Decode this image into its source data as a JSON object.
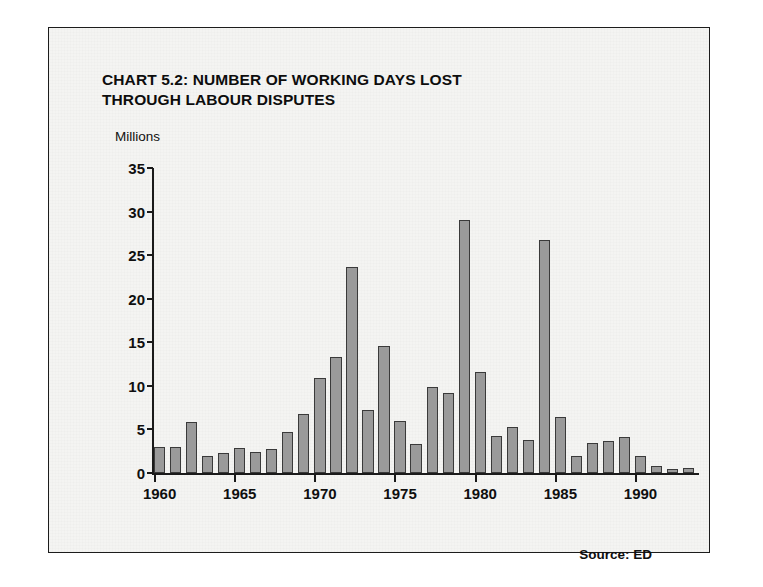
{
  "panel": {
    "title_line1": "CHART 5.2: NUMBER OF WORKING DAYS LOST",
    "title_line2": "THROUGH LABOUR DISPUTES",
    "source": "Source: ED",
    "axis_unit_caption": "Millions"
  },
  "colors": {
    "bar_fill": "#9a9a9a",
    "bar_border": "#3a3a3a",
    "axis": "#1a1a1a",
    "text": "#0f0f0f",
    "paper": "#f4f4f2"
  },
  "chart_data": {
    "type": "bar",
    "title": "CHART 5.2: NUMBER OF WORKING DAYS LOST THROUGH LABOUR DISPUTES",
    "subtitle": "",
    "xlabel": "",
    "ylabel": "Millions",
    "ylim": [
      0,
      35
    ],
    "yticks": [
      0,
      5,
      10,
      15,
      20,
      25,
      30,
      35
    ],
    "ytick_labels": [
      "0",
      "5",
      "10",
      "15",
      "20",
      "25",
      "30",
      "35"
    ],
    "xticks": [
      1960,
      1965,
      1970,
      1975,
      1980,
      1985,
      1990
    ],
    "xtick_labels": [
      "1960",
      "1965",
      "1970",
      "1975",
      "1980",
      "1985",
      "1990"
    ],
    "xlim": [
      1960,
      1994
    ],
    "grid": false,
    "legend": null,
    "source_note": "Source: ED",
    "categories": [
      "1960",
      "1961",
      "1962",
      "1963",
      "1964",
      "1965",
      "1966",
      "1967",
      "1968",
      "1969",
      "1970",
      "1971",
      "1972",
      "1973",
      "1974",
      "1975",
      "1976",
      "1977",
      "1978",
      "1979",
      "1980",
      "1981",
      "1982",
      "1983",
      "1984",
      "1985",
      "1986",
      "1987",
      "1988",
      "1989",
      "1990",
      "1991",
      "1992",
      "1993"
    ],
    "values": [
      3.0,
      3.0,
      5.8,
      2.0,
      2.3,
      2.9,
      2.4,
      2.8,
      4.7,
      6.8,
      10.9,
      13.3,
      23.6,
      7.2,
      14.6,
      6.0,
      3.3,
      9.9,
      9.2,
      29.0,
      11.6,
      4.3,
      5.3,
      3.8,
      26.7,
      6.4,
      1.9,
      3.5,
      3.7,
      4.1,
      1.9,
      0.8,
      0.5,
      0.6
    ]
  }
}
